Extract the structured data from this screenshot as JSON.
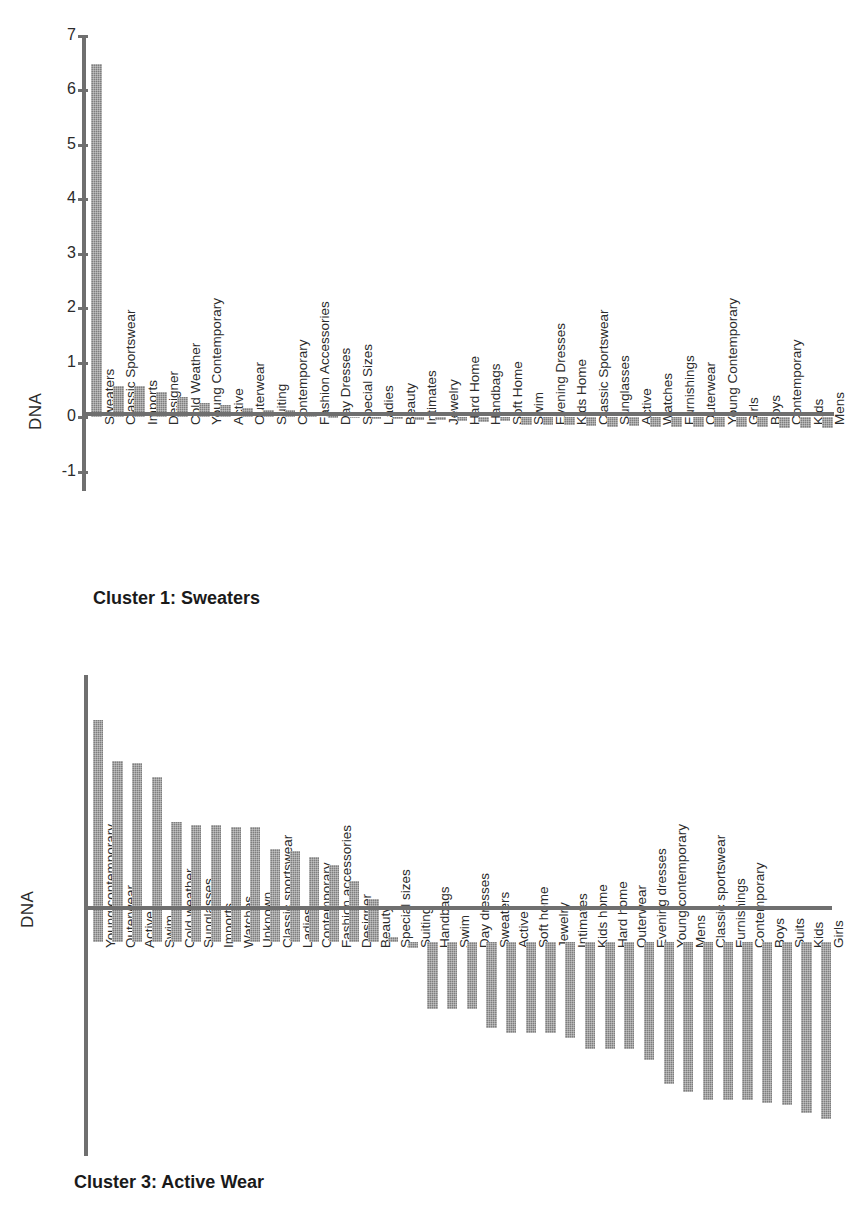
{
  "figure": {
    "ylabel": "DNA"
  },
  "charts": [
    {
      "caption": "Cluster 1: Sweaters",
      "ylabel": "DNA",
      "yticks": [
        "7",
        "6",
        "5",
        "4",
        "3",
        "2",
        "1",
        "0",
        "-1"
      ]
    },
    {
      "caption": "Cluster 3: Active Wear",
      "ylabel": "DNA",
      "yticks": [
        "1",
        "0.8",
        "0.6",
        "0.4",
        "0.2",
        "0",
        "-0.2",
        "-0.4",
        "-0.6",
        "-0.8"
      ]
    }
  ],
  "chart_data": [
    {
      "type": "bar",
      "title": "Cluster 1: Sweaters",
      "xlabel": "",
      "ylabel": "DNA",
      "ylim": [
        -1.35,
        7
      ],
      "grid": false,
      "legend": "none",
      "categories": [
        "Sweaters",
        "Classic Sportswear",
        "Imports",
        "Designer",
        "Cold Weather",
        "Young Contemporary",
        "Active",
        "Outerwear",
        "Suiting",
        "Contemporary",
        "Fashion Accessories",
        "Day Dresses",
        "Special Sizes",
        "Ladies",
        "Beauty",
        "Intimates",
        "Jewelry",
        "Hard Home",
        "Handbags",
        "Soft Home",
        "Swim",
        "Evening Dresses",
        "Kids Home",
        "Classic Sportswear",
        "Sunglasses",
        "Active",
        "Watches",
        "Furnishings",
        "Outerwear",
        "Young Contemporary",
        "Girls",
        "Boys",
        "Contemporary",
        "Kids",
        "Mens"
      ],
      "values": [
        6.48,
        0.58,
        0.58,
        0.47,
        0.37,
        0.26,
        0.22,
        0.17,
        0.13,
        0.13,
        0.05,
        0.02,
        0.01,
        -0.02,
        -0.03,
        -0.04,
        -0.05,
        -0.07,
        -0.09,
        -0.07,
        -0.13,
        -0.13,
        -0.14,
        -0.16,
        -0.17,
        -0.15,
        -0.18,
        -0.17,
        -0.18,
        -0.18,
        -0.18,
        -0.18,
        -0.19,
        -0.19,
        -0.2
      ]
    },
    {
      "type": "bar",
      "title": "Cluster 3: Active Wear",
      "xlabel": "",
      "ylabel": "DNA",
      "ylim": [
        -0.8,
        1
      ],
      "grid": false,
      "legend": "none",
      "categories": [
        "Young contemporary",
        "Outerwear",
        "Active",
        "Swim",
        "Cold weather",
        "Sunglasses",
        "Imports",
        "Watches",
        "Unknown",
        "Classic sportswear",
        "Ladies",
        "Contemporary",
        "Fashion accessories",
        "Designer",
        "Beauty",
        "Special sizes",
        "Suiting",
        "Handbags",
        "Swim",
        "Day dresses",
        "Sweaters",
        "Active",
        "Soft home",
        "Jewelry",
        "Intimates",
        "Kids home",
        "Hard home",
        "Outerwear",
        "Evening dresses",
        "Young contemporary",
        "Mens",
        "Classic sportswear",
        "Furnishings",
        "Contemporary",
        "Boys",
        "Suits",
        "Kids",
        "Girls"
      ],
      "values": [
        0.83,
        0.68,
        0.67,
        0.62,
        0.45,
        0.44,
        0.44,
        0.43,
        0.43,
        0.35,
        0.34,
        0.32,
        0.29,
        0.23,
        0.16,
        0.02,
        -0.02,
        -0.25,
        -0.25,
        -0.25,
        -0.32,
        -0.34,
        -0.34,
        -0.34,
        -0.36,
        -0.4,
        -0.4,
        -0.4,
        -0.44,
        -0.53,
        -0.56,
        -0.59,
        -0.59,
        -0.59,
        -0.6,
        -0.61,
        -0.64,
        -0.66
      ]
    }
  ],
  "colors": {
    "bar": "#7e7e7e",
    "axis": "#6f6f6f",
    "text": "#1a1a1a"
  }
}
